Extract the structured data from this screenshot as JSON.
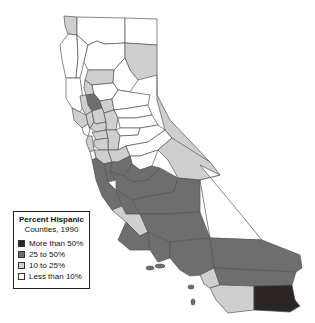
{
  "legend": {
    "title": "Percent Hispanic",
    "subtitle": "Counties, 1990",
    "items": [
      {
        "label": "More than 50%",
        "color": "#2b2526"
      },
      {
        "label": "25 to 50%",
        "color": "#6e6e6e"
      },
      {
        "label": "10 to 25%",
        "color": "#cfcfcf"
      },
      {
        "label": "Less than 10%",
        "color": "#ffffff"
      }
    ]
  },
  "map": {
    "region": "California",
    "categories": {
      "more_than_50": [
        "Imperial"
      ],
      "25_to_50": [
        "Los Angeles",
        "San Bernardino",
        "Riverside",
        "Ventura",
        "Santa Barbara",
        "Kern",
        "Tulare",
        "Kings",
        "Fresno",
        "Madera",
        "Merced",
        "Monterey",
        "San Benito",
        "Colusa"
      ],
      "10_to_25": [
        "San Diego",
        "Orange",
        "San Luis Obispo",
        "Inyo",
        "Mono",
        "Modoc",
        "Del Norte",
        "Santa Clara",
        "Alameda",
        "Contra Costa",
        "San Mateo",
        "San Francisco",
        "Stanislaus",
        "San Joaquin",
        "Sacramento",
        "Yolo",
        "Solano",
        "Napa",
        "Sonoma",
        "Sutter",
        "Yuba",
        "Glenn",
        "Tehama",
        "Lake"
      ],
      "less_than_10": [
        "Siskiyou",
        "Humboldt",
        "Trinity",
        "Shasta",
        "Lassen",
        "Plumas",
        "Butte",
        "Sierra",
        "Nevada",
        "Placer",
        "El Dorado",
        "Amador",
        "Calaveras",
        "Tuolumne",
        "Mariposa",
        "Alpine",
        "Mendocino",
        "Marin",
        "Santa Cruz"
      ]
    }
  }
}
